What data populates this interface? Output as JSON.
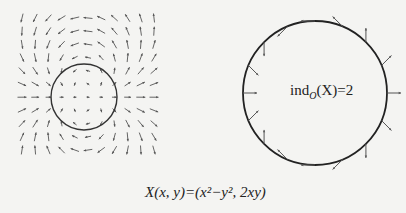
{
  "figure": {
    "left_panel": {
      "description": "vector field plot",
      "grid": {
        "x_start": 22,
        "y_start": 38,
        "step": 13.2,
        "cols": 11,
        "rows": 11
      },
      "circle": {
        "cx": 84,
        "cy": 97,
        "r": 33
      }
    },
    "right_panel": {
      "circle": {
        "cx": 315,
        "cy": 93,
        "r": 72
      },
      "arrow_count": 16,
      "label": {
        "prefix": "ind",
        "subscript": "O",
        "suffix": "(X)=2"
      }
    },
    "caption": "X(x, y)=(x²−y², 2xy)"
  },
  "colors": {
    "stroke": "#333333",
    "arrow": "#555555",
    "background": "#f4f4f2"
  }
}
